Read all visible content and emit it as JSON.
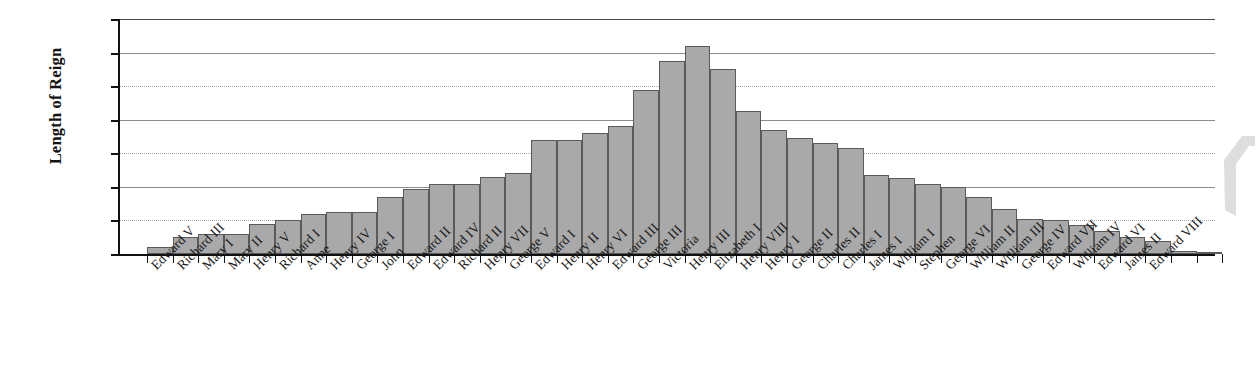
{
  "chart_data": {
    "type": "bar",
    "title": "",
    "xlabel": "",
    "ylabel": "Length of Reign",
    "ylim": [
      0,
      70
    ],
    "yticks": [
      0,
      10,
      20,
      30,
      40,
      50,
      60,
      70
    ],
    "grid": true,
    "legend": "none",
    "orientation": "vertical",
    "bar_color": "#a9a9a9",
    "bar_border_color": "#5a5a5a",
    "axis_color": "#111111",
    "categories": [
      "Edward V",
      "Richard III",
      "Mary I",
      "Mary II",
      "Henry V",
      "Richard I",
      "Anne",
      "Henry IV",
      "George I",
      "John",
      "Edward II",
      "Edward IV",
      "Richard II",
      "Henry VII",
      "George V",
      "Edward I",
      "Henry II",
      "Henry VI",
      "Edward III",
      "George III",
      "Victoria",
      "Henry III",
      "Elizabeth I",
      "Henry VIII",
      "Henry I",
      "George II",
      "Charles II",
      "Charles I",
      "James I",
      "William I",
      "Stephen",
      "George VI",
      "William II",
      "William III",
      "George IV",
      "Edward VII",
      "William IV",
      "Edward VI",
      "James II",
      "Edward VIII"
    ],
    "values": [
      2,
      5,
      6,
      6,
      9,
      10,
      12,
      12.5,
      12.5,
      17,
      19.5,
      21,
      21,
      23,
      24,
      34,
      34,
      36,
      38,
      49,
      57.5,
      62,
      55,
      42.5,
      37,
      34.5,
      33,
      31.5,
      23.5,
      22.5,
      21,
      20,
      17,
      13.5,
      10.5,
      10,
      8.5,
      7,
      5,
      4
    ],
    "tail_values": [
      1,
      0.3
    ],
    "tail_categories": [
      "James II",
      "Edward VIII"
    ],
    "n_bars": 42
  },
  "axis": {
    "y_title": "Length of Reign",
    "y_tick_labels": [
      "70",
      "60",
      "50",
      "40",
      "30",
      "20",
      "10",
      "0"
    ]
  }
}
